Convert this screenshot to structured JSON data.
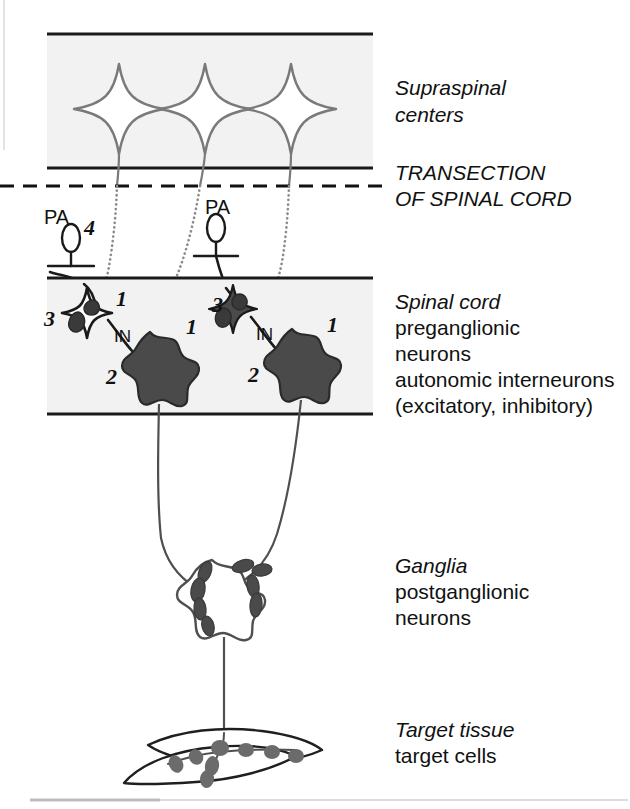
{
  "figure": {
    "background": "#ffffff",
    "band_fill": "#f2f2f2",
    "ink": "#111111",
    "gray_ink": "#7a7a7a",
    "filled_cell": "#4a4a4a"
  },
  "labels": {
    "supraspinal_line1": "Supraspinal",
    "supraspinal_line2": "centers",
    "transection_line1": "TRANSECTION",
    "transection_line2": "OF SPINAL CORD",
    "spinal_title": "Spinal cord",
    "spinal_line2": "preganglionic",
    "spinal_line3": "neurons",
    "spinal_line4": "autonomic interneurons",
    "spinal_line5": "(excitatory, inhibitory)",
    "ganglia_title": "Ganglia",
    "ganglia_line2": "postganglionic",
    "ganglia_line3": "neurons",
    "target_title": "Target tissue",
    "target_line2": "target cells"
  },
  "markers": {
    "pa_left": "PA",
    "pa_right": "PA",
    "in_left": "IN",
    "in_right": "IN",
    "num_4": "4",
    "num_3_left": "3",
    "num_1_left": "1",
    "num_2_left": "2",
    "num_1_left_preg": "1",
    "num_3_right": "3",
    "num_1_right": "1",
    "num_2_right": "2",
    "num_1_right_preg": "1"
  },
  "diagram_data": {
    "type": "diagram",
    "bands": [
      {
        "name": "supraspinal-band",
        "x": 47,
        "y": 33,
        "width": 326,
        "height": 136
      },
      {
        "name": "spinal-cord-band",
        "x": 47,
        "y": 277,
        "width": 326,
        "height": 137
      }
    ],
    "transection": {
      "name": "transection-dashed-line",
      "x1": 0,
      "y1": 186,
      "x2": 386,
      "y2": 186
    },
    "supraspinal_cells": [
      {
        "cx": 119,
        "cy": 109
      },
      {
        "cx": 205,
        "cy": 109
      },
      {
        "cx": 291,
        "cy": 109
      }
    ],
    "primary_afferents": [
      {
        "name": "pa-left",
        "cx": 71,
        "cy": 238
      },
      {
        "name": "pa-right",
        "cx": 216,
        "cy": 228
      }
    ],
    "interneurons": [
      {
        "name": "in-left-excitatory",
        "cx": 87,
        "cy": 313,
        "fill": "open"
      },
      {
        "name": "in-right-inhibitory",
        "cx": 233,
        "cy": 308,
        "fill": "filled"
      }
    ],
    "preganglionic_cells": [
      {
        "name": "preganglionic-left",
        "cx": 150,
        "cy": 363
      },
      {
        "name": "preganglionic-right",
        "cx": 292,
        "cy": 360
      }
    ],
    "ganglion_cell": {
      "name": "ganglion-postganglionic-neuron",
      "cx": 212,
      "cy": 588
    },
    "target_cells": [
      {
        "name": "target-cell-upper",
        "cx": 232,
        "cy": 750
      },
      {
        "name": "target-cell-lower",
        "cx": 205,
        "cy": 762
      }
    ],
    "legend_numbers": {
      "1": "descending supraspinal input terminals",
      "2": "interneuron to preganglionic neuron synapse",
      "3": "primary afferent to interneuron synapse",
      "4": "primary afferent soma"
    }
  }
}
